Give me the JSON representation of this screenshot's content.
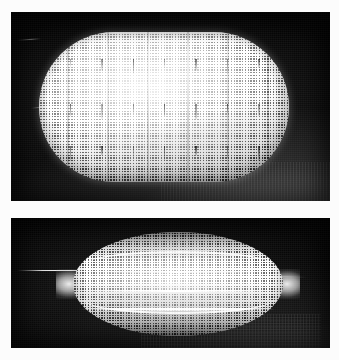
{
  "figure": {
    "title": "Two-panel photographic figure of a woven wire-mesh specimen",
    "background_color": "#fdfdfd",
    "panel_background_color": "#050505",
    "specimen_color": "#d8d8d8",
    "width_px": 339,
    "height_px": 360,
    "caption": "",
    "panel_count": 2
  },
  "panels": [
    {
      "id": "panel-top",
      "label": "",
      "description": "Undeformed woven mesh specimen, stadium (rounded-rectangle) outline, photographed against a black background with a lit grey region at lower right.",
      "specimen_shape": "stadium",
      "specimen_state": "undeformed",
      "mesh_visible": "true",
      "mesh_pitch_px": 2.8,
      "frame": {
        "x": 11,
        "y": 12,
        "width": 319,
        "height": 189
      },
      "specimen_bounds": {
        "x": 39,
        "y": 32,
        "width": 250,
        "height": 150
      },
      "artifacts": [
        "thin curved filament at left edge",
        "vertical dark weft striations",
        "three rows of short dark tick marks"
      ]
    },
    {
      "id": "panel-bottom",
      "label": "",
      "description": "Same mesh specimen after axial compression: collapsed into a pointed lens / leaf outline with bright lens-shaped fold creases running lengthwise.",
      "specimen_shape": "lens",
      "specimen_state": "deformed",
      "mesh_visible": "true",
      "mesh_pitch_px": 2.7,
      "frame": {
        "x": 11,
        "y": 218,
        "width": 319,
        "height": 130
      },
      "specimen_bounds": {
        "x": 56,
        "y": 232,
        "width": 230,
        "height": 104
      },
      "artifacts": [
        "horizontal wire/filament entering from left edge",
        "three bright lens-shaped crease highlights",
        "pointed tips at left and right"
      ]
    }
  ],
  "tick_rows": {
    "row_tops_pct": [
      18,
      48,
      76
    ],
    "tick_count": 7,
    "tick_color": "#000000"
  },
  "folds": {
    "count": 3,
    "highlight_color": "#ffffff",
    "positions_pct": [
      22,
      40,
      58
    ]
  }
}
